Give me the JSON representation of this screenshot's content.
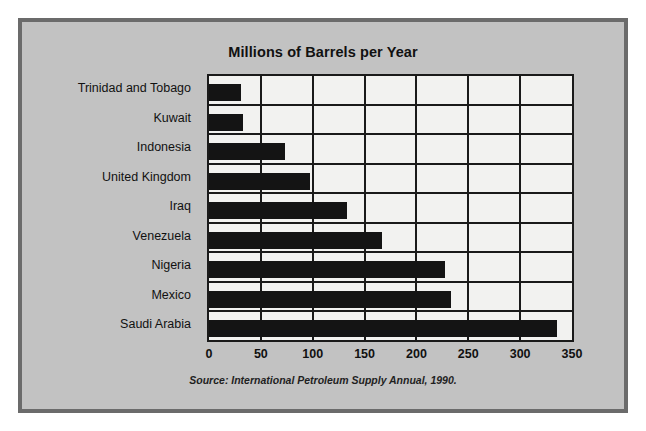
{
  "chart_data": {
    "type": "bar",
    "orientation": "horizontal",
    "title": "Millions of Barrels per Year",
    "xlabel": "",
    "ylabel": "",
    "categories": [
      "Trinidad and Tobago",
      "Kuwait",
      "Indonesia",
      "United Kingdom",
      "Iraq",
      "Venezuela",
      "Nigeria",
      "Mexico",
      "Saudi Arabia"
    ],
    "values": [
      31,
      33,
      73,
      97,
      133,
      167,
      228,
      233,
      336
    ],
    "xlim": [
      0,
      350
    ],
    "xticks": [
      0,
      50,
      100,
      150,
      200,
      250,
      300,
      350
    ],
    "xtick_labels": [
      "0",
      "50",
      "100",
      "150",
      "200",
      "250",
      "300",
      "350"
    ],
    "grid": true,
    "grid_axis": "both",
    "legend": false,
    "source": "Source: International Petroleum Supply Annual, 1990.",
    "colors": {
      "bar": "#141414",
      "plot_background": "#f2f2f0",
      "figure_background": "#c2c2c2",
      "frame": "#6b6b6b",
      "axis": "#1a1a1a",
      "text": "#111111"
    }
  }
}
